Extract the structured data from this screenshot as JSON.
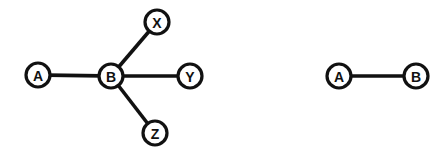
{
  "figure": {
    "background_color": "#ffffff",
    "stroke_color": "#111111",
    "node_fill_color": "#ffffff",
    "width": 446,
    "height": 155
  },
  "graphs": [
    {
      "id": "star-graph",
      "name": "left-graph",
      "nodes": [
        {
          "id": "A",
          "label": "A",
          "cx": 38,
          "cy": 75,
          "r": 12
        },
        {
          "id": "B",
          "label": "B",
          "cx": 111,
          "cy": 76,
          "r": 12
        },
        {
          "id": "X",
          "label": "X",
          "cx": 157,
          "cy": 22,
          "r": 12
        },
        {
          "id": "Y",
          "label": "Y",
          "cx": 190,
          "cy": 76,
          "r": 12
        },
        {
          "id": "Z",
          "label": "Z",
          "cx": 155,
          "cy": 133,
          "r": 12
        }
      ],
      "edges": [
        {
          "from": "A",
          "to": "B"
        },
        {
          "from": "B",
          "to": "X"
        },
        {
          "from": "B",
          "to": "Y"
        },
        {
          "from": "B",
          "to": "Z"
        }
      ]
    },
    {
      "id": "pair-graph",
      "name": "right-graph",
      "nodes": [
        {
          "id": "A2",
          "label": "A",
          "cx": 339,
          "cy": 76,
          "r": 12
        },
        {
          "id": "B2",
          "label": "B",
          "cx": 416,
          "cy": 76,
          "r": 12
        }
      ],
      "edges": [
        {
          "from": "A2",
          "to": "B2"
        }
      ]
    }
  ]
}
